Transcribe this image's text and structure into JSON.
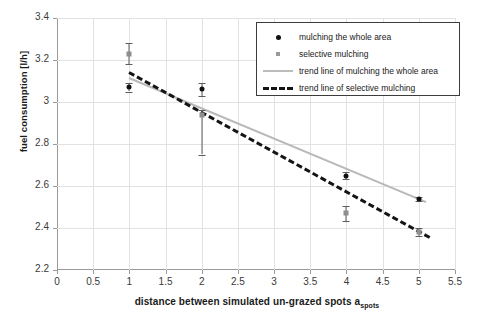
{
  "chart_data": {
    "type": "scatter",
    "title": "",
    "xlabel": "distance between simulated un-grazed spots a_spots",
    "xlabel_main": "distance between simulated un-grazed spots a",
    "xlabel_sub": "spots",
    "ylabel": "fuel consumption [l/h]",
    "xlim": [
      0,
      5.5
    ],
    "ylim": [
      2.2,
      3.4
    ],
    "xticks": [
      "0",
      "0.5",
      "1",
      "1.5",
      "2",
      "2.5",
      "3",
      "3.5",
      "4",
      "4.5",
      "5",
      "5.5"
    ],
    "yticks": [
      "2.2",
      "2.4",
      "2.6",
      "2.8",
      "3",
      "3.2",
      "3.4"
    ],
    "grid": true,
    "legend_position": "top-right",
    "series": [
      {
        "name": "mulching the whole area",
        "marker": "circle",
        "color": "#101010",
        "x": [
          1,
          2,
          4,
          5
        ],
        "y": [
          3.07,
          3.06,
          2.65,
          2.54
        ],
        "yerr_low": [
          0.02,
          0.03,
          0.015,
          0.01
        ],
        "yerr_high": [
          0.02,
          0.03,
          0.015,
          0.01
        ]
      },
      {
        "name": "selective mulching",
        "marker": "square",
        "color": "#8e8e8e",
        "x": [
          1,
          2,
          4,
          5
        ],
        "y": [
          3.23,
          2.94,
          2.47,
          2.38
        ],
        "yerr_low": [
          0.05,
          0.19,
          0.035,
          0.02
        ],
        "yerr_high": [
          0.05,
          0.02,
          0.035,
          0.02
        ]
      }
    ],
    "trend_lines": [
      {
        "name": "trend line of mulching the whole area",
        "style": "solid",
        "color": "#b9b9b9",
        "x": [
          1,
          5.1
        ],
        "y": [
          3.12,
          2.53
        ]
      },
      {
        "name": "trend line of selective mulching",
        "style": "dashed",
        "color": "#141414",
        "x": [
          1,
          5.15
        ],
        "y": [
          3.15,
          2.365
        ]
      }
    ],
    "legend": [
      {
        "label": "mulching the whole area",
        "key": "dot"
      },
      {
        "label": "selective mulching",
        "key": "square"
      },
      {
        "label": "trend line of mulching the whole area",
        "key": "line"
      },
      {
        "label": "trend line of selective mulching",
        "key": "dash"
      }
    ]
  }
}
